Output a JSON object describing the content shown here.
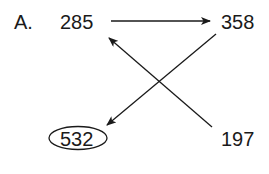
{
  "diagram": {
    "problem_label": "A.",
    "nodes": [
      {
        "id": "n285",
        "value": "285",
        "position": "top-left",
        "circled": false
      },
      {
        "id": "n358",
        "value": "358",
        "position": "top-right",
        "circled": false
      },
      {
        "id": "n532",
        "value": "532",
        "position": "bottom-left",
        "circled": true
      },
      {
        "id": "n197",
        "value": "197",
        "position": "bottom-right",
        "circled": false
      }
    ],
    "edges": [
      {
        "from": "285",
        "to": "358",
        "direction": "right"
      },
      {
        "from": "358",
        "to": "532",
        "direction": "down-left"
      },
      {
        "from": "197",
        "to": "285",
        "direction": "up-left"
      }
    ],
    "colors": {
      "stroke": "#1a1a1a",
      "background": "#ffffff"
    }
  }
}
